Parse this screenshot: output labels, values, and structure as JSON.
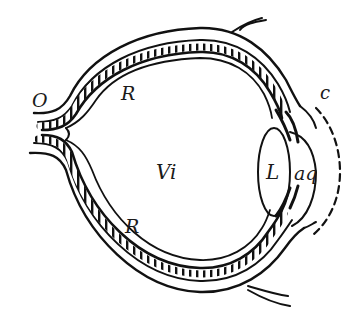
{
  "figure": {
    "type": "anatomical cross-section",
    "stroke_color": "#111111",
    "background_color": "#ffffff"
  },
  "labels": {
    "optic_nerve": "O",
    "retina_top": "R",
    "vitreous": "Vi",
    "lens": "L",
    "aqueous": "aq",
    "retina_bottom": "R",
    "cornea": "c"
  }
}
